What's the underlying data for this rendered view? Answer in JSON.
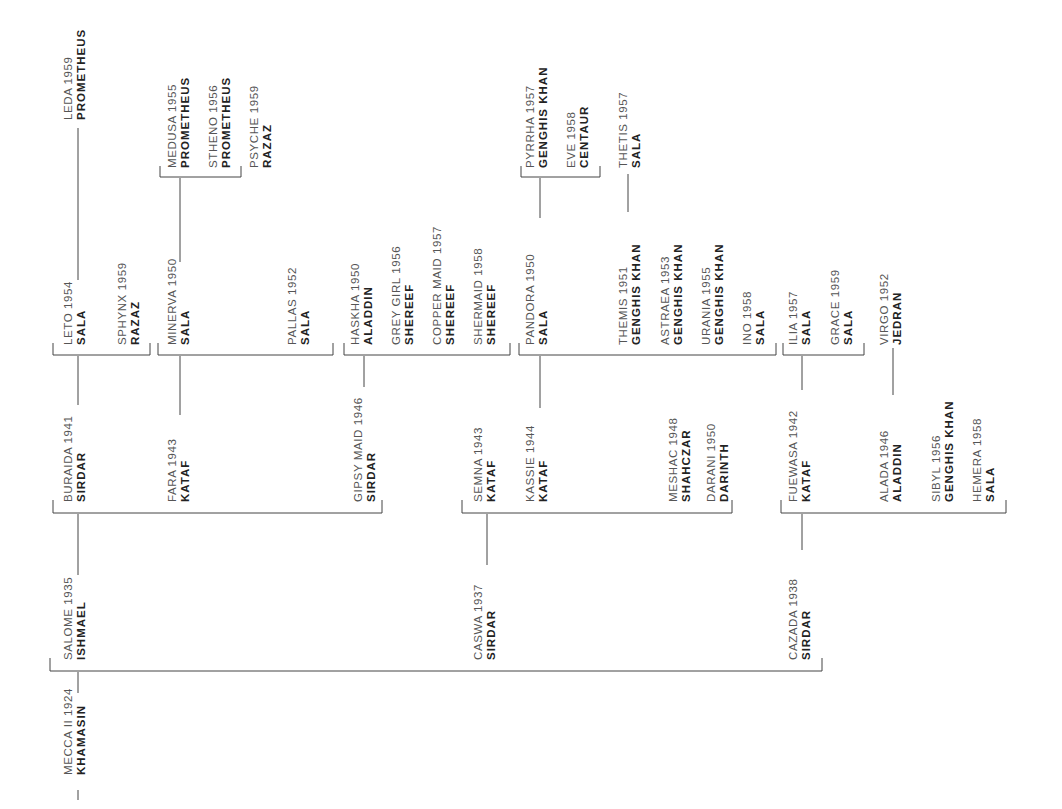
{
  "diagram": {
    "type": "pedigree-tree",
    "orientation": "rotated-90",
    "nodes": [
      {
        "id": "mecca",
        "name": "MECCA II 1924",
        "sire": "KHAMASIN",
        "x": 62,
        "y": 775
      },
      {
        "id": "salome",
        "name": "SALOME 1935",
        "sire": "ISHMAEL",
        "x": 62,
        "y": 660
      },
      {
        "id": "caswa",
        "name": "CASWA 1937",
        "sire": "SIRDAR",
        "x": 472,
        "y": 660
      },
      {
        "id": "cazada",
        "name": "CAZADA 1938",
        "sire": "SIRDAR",
        "x": 787,
        "y": 660
      },
      {
        "id": "buraida",
        "name": "BURAIDA 1941",
        "sire": "SIRDAR",
        "x": 62,
        "y": 502
      },
      {
        "id": "fara",
        "name": "FARA 1943",
        "sire": "KATAF",
        "x": 166,
        "y": 502
      },
      {
        "id": "gipsymaid",
        "name": "GIPSY MAID 1946",
        "sire": "SIRDAR",
        "x": 352,
        "y": 502
      },
      {
        "id": "semna",
        "name": "SEMNA 1943",
        "sire": "KATAF",
        "x": 472,
        "y": 502
      },
      {
        "id": "kassie",
        "name": "KASSIE 1944",
        "sire": "KATAF",
        "x": 524,
        "y": 502
      },
      {
        "id": "meshac",
        "name": "MESHAC 1948",
        "sire": "SHAHCZAR",
        "x": 667,
        "y": 502
      },
      {
        "id": "darani",
        "name": "DARANI 1950",
        "sire": "DARINTH",
        "x": 705,
        "y": 502
      },
      {
        "id": "fuewasa",
        "name": "FUEWASA 1942",
        "sire": "KATAF",
        "x": 787,
        "y": 502
      },
      {
        "id": "alada",
        "name": "ALADA 1946",
        "sire": "ALADDIN",
        "x": 878,
        "y": 502
      },
      {
        "id": "sibyl",
        "name": "SIBYL 1956",
        "sire": "GENGHIS KHAN",
        "x": 930,
        "y": 502
      },
      {
        "id": "hemera",
        "name": "HEMERA 1958",
        "sire": "SALA",
        "x": 971,
        "y": 502
      },
      {
        "id": "leto",
        "name": "LETO 1954",
        "sire": "SALA",
        "x": 62,
        "y": 345
      },
      {
        "id": "sphynx",
        "name": "SPHYNX 1959",
        "sire": "RAZAZ",
        "x": 116,
        "y": 345
      },
      {
        "id": "minerva",
        "name": "MINERVA 1950",
        "sire": "SALA",
        "x": 166,
        "y": 345
      },
      {
        "id": "pallas",
        "name": "PALLAS 1952",
        "sire": "SALA",
        "x": 286,
        "y": 345
      },
      {
        "id": "haskha",
        "name": "HASKHA 1950",
        "sire": "ALADDIN",
        "x": 349,
        "y": 345
      },
      {
        "id": "greygirl",
        "name": "GREY GIRL 1956",
        "sire": "SHEREEF",
        "x": 390,
        "y": 345
      },
      {
        "id": "coppermaid",
        "name": "COPPER MAID 1957",
        "sire": "SHEREEF",
        "x": 431,
        "y": 345
      },
      {
        "id": "shermaid",
        "name": "SHERMAID 1958",
        "sire": "SHEREEF",
        "x": 472,
        "y": 345
      },
      {
        "id": "pandora",
        "name": "PANDORA 1950",
        "sire": "SALA",
        "x": 524,
        "y": 345
      },
      {
        "id": "themis",
        "name": "THEMIS 1951",
        "sire": "GENGHIS KHAN",
        "x": 617,
        "y": 345
      },
      {
        "id": "astraea",
        "name": "ASTRAEA 1953",
        "sire": "GENGHIS KHAN",
        "x": 659,
        "y": 345
      },
      {
        "id": "urania",
        "name": "URANIA 1955",
        "sire": "GENGHIS KHAN",
        "x": 700,
        "y": 345
      },
      {
        "id": "ino",
        "name": "INO 1958",
        "sire": "SALA",
        "x": 741,
        "y": 345
      },
      {
        "id": "ilia",
        "name": "ILIA 1957",
        "sire": "SALA",
        "x": 787,
        "y": 345
      },
      {
        "id": "grace",
        "name": "GRACE 1959",
        "sire": "SALA",
        "x": 829,
        "y": 345
      },
      {
        "id": "virgo",
        "name": "VIRGO 1952",
        "sire": "JEDRAN",
        "x": 878,
        "y": 345
      },
      {
        "id": "leda",
        "name": "LEDA 1959",
        "sire": "PROMETHEUS",
        "x": 62,
        "y": 120
      },
      {
        "id": "medusa",
        "name": "MEDUSA 1955",
        "sire": "PROMETHEUS",
        "x": 166,
        "y": 168
      },
      {
        "id": "stheno",
        "name": "STHENO 1956",
        "sire": "PROMETHEUS",
        "x": 207,
        "y": 168
      },
      {
        "id": "psyche",
        "name": "PSYCHE 1959",
        "sire": "RAZAZ",
        "x": 248,
        "y": 168
      },
      {
        "id": "pyrrha",
        "name": "PYRRHA 1957",
        "sire": "GENGHIS KHAN",
        "x": 524,
        "y": 168
      },
      {
        "id": "eve",
        "name": "EVE 1958",
        "sire": "CENTAUR",
        "x": 565,
        "y": 168
      },
      {
        "id": "thetis",
        "name": "THETIS 1957",
        "sire": "SALA",
        "x": 617,
        "y": 168
      }
    ]
  }
}
